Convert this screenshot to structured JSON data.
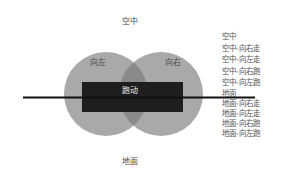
{
  "diagram": {
    "top_label": "空中",
    "bottom_label": "地面",
    "left_circle_label": "向左",
    "right_circle_label": "向右",
    "center_label": "跑动",
    "colors": {
      "circle": "#a8a8a8",
      "overlap": "#8c8c8c",
      "rect": "#1e1e1e",
      "line": "#111111"
    }
  },
  "legend": {
    "air": [
      "空中",
      "空中-向右走",
      "空中-向左走",
      "空中-向右跑",
      "空中-向左跑"
    ],
    "ground": [
      "地面",
      "地面-向右走",
      "地面-向左走",
      "地面-向右跑",
      "地面-向左跑"
    ]
  }
}
